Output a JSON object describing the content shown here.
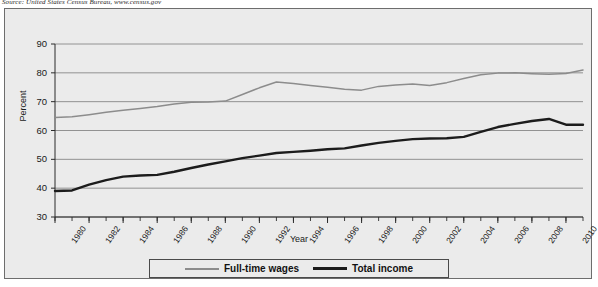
{
  "source_note": "Source: United States Census Bureau, www.census.gov",
  "legend": {
    "items": [
      {
        "label": "Full-time wages",
        "color": "#8c8c8c",
        "style": "thin"
      },
      {
        "label": "Total income",
        "color": "#1c1c1c",
        "style": "thick"
      }
    ]
  },
  "chart_data": {
    "type": "line",
    "title": "",
    "xlabel": "Year",
    "ylabel": "Percent",
    "xlim": [
      1980,
      2011
    ],
    "ylim": [
      30,
      90
    ],
    "ytick_labels": [
      "30",
      "40",
      "50",
      "60",
      "70",
      "80",
      "90"
    ],
    "ytick_values": [
      30,
      40,
      50,
      60,
      70,
      80,
      90
    ],
    "xtick_labels": [
      "1980",
      "1982",
      "1984",
      "1986",
      "1988",
      "1990",
      "1992",
      "1994",
      "1996",
      "1998",
      "2000",
      "2002",
      "2004",
      "2006",
      "2008",
      "2010"
    ],
    "xtick_values": [
      1980,
      1982,
      1984,
      1986,
      1988,
      1990,
      1992,
      1994,
      1996,
      1998,
      2000,
      2002,
      2004,
      2006,
      2008,
      2010
    ],
    "minor_tick_interval": 1,
    "grid": "horizontal",
    "legend_position": "bottom",
    "x": [
      1980,
      1981,
      1982,
      1983,
      1984,
      1985,
      1986,
      1987,
      1988,
      1989,
      1990,
      1991,
      1992,
      1993,
      1994,
      1995,
      1996,
      1997,
      1998,
      1999,
      2000,
      2001,
      2002,
      2003,
      2004,
      2005,
      2006,
      2007,
      2008,
      2009,
      2010,
      2011
    ],
    "series": [
      {
        "name": "Full-time wages",
        "color": "#8c8c8c",
        "values": [
          64.5,
          64.8,
          65.5,
          66.3,
          67.0,
          67.6,
          68.3,
          69.2,
          69.8,
          69.9,
          70.2,
          72.5,
          74.8,
          76.8,
          76.3,
          75.6,
          75.0,
          74.3,
          74.0,
          75.3,
          75.8,
          76.1,
          75.6,
          76.6,
          78.0,
          79.3,
          79.9,
          80.0,
          79.7,
          79.5,
          79.8,
          81.0
        ]
      },
      {
        "name": "Total income",
        "color": "#1c1c1c",
        "values": [
          39.0,
          39.2,
          41.2,
          42.8,
          44.0,
          44.4,
          44.6,
          45.7,
          47.0,
          48.2,
          49.3,
          50.4,
          51.3,
          52.2,
          52.6,
          53.0,
          53.5,
          53.8,
          54.8,
          55.7,
          56.4,
          57.0,
          57.2,
          57.3,
          57.8,
          59.5,
          61.2,
          62.3,
          63.3,
          64.0,
          62.0,
          62.0
        ]
      }
    ]
  }
}
